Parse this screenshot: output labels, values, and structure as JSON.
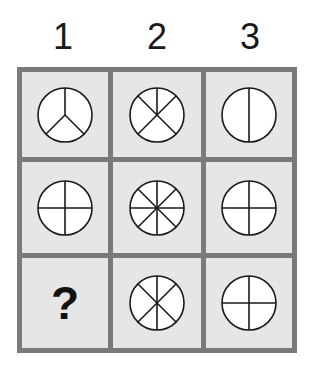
{
  "puzzle": {
    "column_headers": [
      "1",
      "2",
      "3"
    ],
    "colors": {
      "grid_border": "#7a7a7a",
      "cell_background": "#e6e6e6",
      "circle_fill": "#ffffff",
      "stroke": "#1a1a1a"
    },
    "rows": [
      [
        {
          "type": "circle",
          "description": "circle divided into 3 sectors (Y / peace-sign shape)",
          "lines": [
            "center-top",
            "center-bottomleft",
            "center-bottomright"
          ]
        },
        {
          "type": "circle",
          "description": "circle with two full diagonals and a half vertical line to the top (5 sectors)",
          "lines": [
            "diag-1",
            "diag-2",
            "center-top"
          ]
        },
        {
          "type": "circle",
          "description": "circle divided by one vertical line (2 sectors)",
          "lines": [
            "vertical"
          ]
        }
      ],
      [
        {
          "type": "circle",
          "description": "circle divided by a cross (4 sectors)",
          "lines": [
            "vertical",
            "horizontal"
          ]
        },
        {
          "type": "circle",
          "description": "circle divided into 8 sectors",
          "lines": [
            "vertical",
            "horizontal",
            "diag-1",
            "diag-2"
          ]
        },
        {
          "type": "circle",
          "description": "circle divided by a cross (4 sectors)",
          "lines": [
            "vertical",
            "horizontal"
          ]
        }
      ],
      [
        {
          "type": "question",
          "label": "?"
        },
        {
          "type": "circle",
          "description": "circle with full vertical line and two full diagonals (6 sectors)",
          "lines": [
            "vertical",
            "diag-1",
            "diag-2"
          ]
        },
        {
          "type": "circle",
          "description": "circle divided by a cross (4 sectors)",
          "lines": [
            "vertical",
            "horizontal"
          ]
        }
      ]
    ],
    "question_mark": "?"
  }
}
